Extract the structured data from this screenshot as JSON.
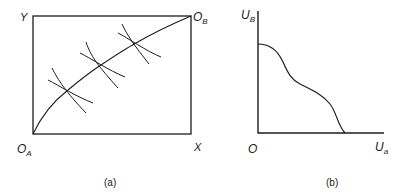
{
  "panel_a": {
    "caption": "(a)",
    "labels": {
      "y_corner": "Y",
      "origin_b_main": "O",
      "origin_b_sub": "B",
      "origin_a_main": "O",
      "origin_a_sub": "A",
      "x_corner": "X"
    },
    "box": {
      "x0": 33,
      "y0": 16,
      "x1": 191,
      "y1": 134
    },
    "contract_curve": {
      "from": "O_A",
      "to": "O_B"
    },
    "tangency_points": [
      {
        "x": 68,
        "y": 90
      },
      {
        "x": 101,
        "y": 65
      },
      {
        "x": 136,
        "y": 43
      }
    ]
  },
  "panel_b": {
    "caption": "(b)",
    "labels": {
      "y_axis_main": "U",
      "y_axis_sub": "B",
      "origin": "O",
      "x_axis_main": "U",
      "x_axis_sub": "a"
    },
    "curve": "utility possibility frontier"
  },
  "colors": {
    "ink": "#1c1c1c",
    "background": "#ffffff"
  }
}
